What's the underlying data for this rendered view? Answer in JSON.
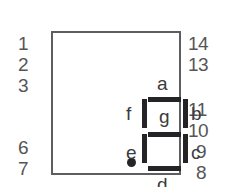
{
  "diagram": {
    "package": {
      "outline_color": "#5e5e61"
    },
    "pins": {
      "left_top": [
        "1",
        "2",
        "3"
      ],
      "left_bottom": [
        "6",
        "7"
      ],
      "right_top": [
        "14",
        "13"
      ],
      "right_middle": [
        "11",
        "10"
      ],
      "right_bottom": [
        "9",
        "8"
      ]
    },
    "segments": {
      "color": "#242426",
      "labels": {
        "a": "a",
        "b": "b",
        "c": "c",
        "d": "d",
        "e": "e",
        "f": "f",
        "g": "g"
      }
    },
    "decimal_point": {
      "present": true,
      "color": "#242426"
    }
  }
}
